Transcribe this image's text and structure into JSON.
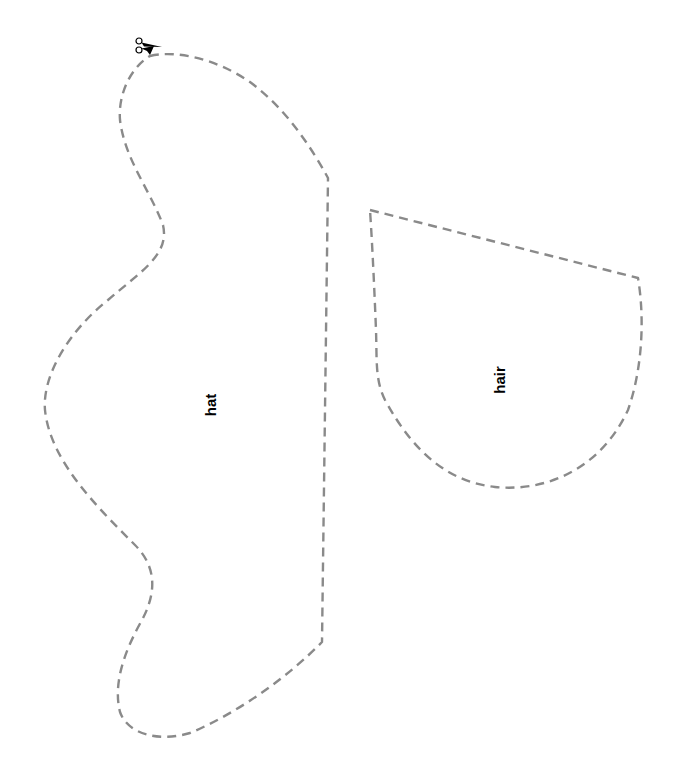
{
  "pieces": [
    {
      "name": "hat",
      "label": "hat"
    },
    {
      "name": "hair",
      "label": "hair"
    }
  ],
  "icons": {
    "cut_start": "scissors-icon"
  },
  "colors": {
    "cut_line": "#8a8a8a",
    "label": "#000000",
    "background": "#ffffff"
  }
}
